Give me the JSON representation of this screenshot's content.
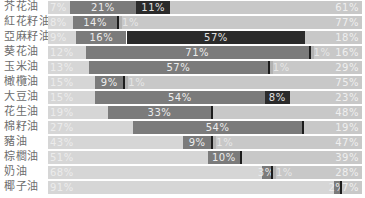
{
  "chart_data": {
    "type": "bar",
    "orientation": "horizontal",
    "stacked": true,
    "normalized_percent": true,
    "title": "",
    "xlabel": "",
    "ylabel": "",
    "xlim": [
      0,
      100
    ],
    "grid": false,
    "legend": "none",
    "categories": [
      "芥花油",
      "紅花籽油",
      "亞麻籽油",
      "葵花油",
      "玉米油",
      "橄欖油",
      "大豆油",
      "花生油",
      "棉籽油",
      "豬油",
      "棕櫚油",
      "奶油",
      "椰子油"
    ],
    "series": [
      {
        "name": "segment-1",
        "color": "#d6d6d6",
        "text_color": "#ececec",
        "values": [
          7,
          8,
          9,
          12,
          13,
          15,
          15,
          19,
          27,
          43,
          51,
          68,
          91
        ]
      },
      {
        "name": "segment-2",
        "color": "#7b7b7b",
        "text_color": "#ececec",
        "values": [
          21,
          14,
          16,
          71,
          57,
          9,
          54,
          33,
          54,
          9,
          10,
          3,
          2
        ]
      },
      {
        "name": "segment-3",
        "color": "#2b2b2b",
        "text_color": "#e0e0e0",
        "values": [
          11,
          0,
          57,
          0,
          0,
          0,
          8,
          0,
          0,
          0,
          0,
          0,
          0
        ]
      },
      {
        "name": "segment-4",
        "color": "#b2b2b2",
        "text_color": "#e6e6e6",
        "values": [
          0,
          1,
          0,
          1,
          1,
          1,
          0,
          0,
          0,
          1,
          0,
          1,
          0
        ]
      },
      {
        "name": "segment-5",
        "color": "#c8c8c8",
        "text_color": "#efefef",
        "values": [
          61,
          77,
          18,
          16,
          29,
          75,
          23,
          48,
          19,
          47,
          39,
          28,
          7
        ]
      }
    ],
    "trace_marker": {
      "color": "#1c1c1c",
      "present": [
        false,
        true,
        false,
        true,
        true,
        true,
        false,
        true,
        true,
        true,
        true,
        true,
        true
      ]
    },
    "value_labels": [
      [
        "7%",
        "21%",
        "11%",
        "",
        "61%"
      ],
      [
        "8%",
        "14%",
        "",
        "1%",
        "77%"
      ],
      [
        "9%",
        "16%",
        "57%",
        "",
        "18%"
      ],
      [
        "12%",
        "71%",
        "",
        "1%",
        "16%"
      ],
      [
        "13%",
        "57%",
        "",
        "1%",
        "29%"
      ],
      [
        "15%",
        "9%",
        "",
        "1%",
        "75%"
      ],
      [
        "15%",
        "54%",
        "8%",
        "",
        "23%"
      ],
      [
        "19%",
        "33%",
        "",
        "",
        "48%"
      ],
      [
        "27%",
        "54%",
        "",
        "",
        "19%"
      ],
      [
        "43%",
        "9%",
        "",
        "1%",
        "47%"
      ],
      [
        "51%",
        "10%",
        "",
        "",
        "39%"
      ],
      [
        "68%",
        "3%",
        "",
        "1%",
        "28%"
      ],
      [
        "91%",
        "2%",
        "",
        "",
        "7%"
      ]
    ]
  }
}
